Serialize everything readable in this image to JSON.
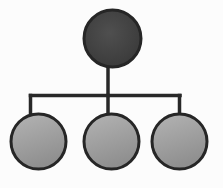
{
  "diagram": {
    "type": "tree",
    "canvas": {
      "width": 223,
      "height": 188,
      "background": "#fcfcfc"
    },
    "connector": {
      "color": "#282828",
      "width": 3.5
    },
    "node_style": {
      "stroke": "#262626",
      "stroke_width": 3,
      "parent_fill_center": "#4f4f4f",
      "parent_fill_edge": "#383838",
      "child_fill_light": "#b4b4b4",
      "child_fill_dark": "#8f8f8f"
    },
    "nodes": [
      {
        "id": "parent",
        "role": "parent",
        "cx": 112.5,
        "cy": 38.5,
        "r": 28.5,
        "shade": "dark"
      },
      {
        "id": "child-1",
        "role": "child",
        "cx": 38.5,
        "cy": 141.5,
        "r": 27.5,
        "shade": "light"
      },
      {
        "id": "child-2",
        "role": "child",
        "cx": 111.5,
        "cy": 141.5,
        "r": 27.5,
        "shade": "light"
      },
      {
        "id": "child-3",
        "role": "child",
        "cx": 179.5,
        "cy": 141.5,
        "r": 27.5,
        "shade": "light"
      }
    ],
    "edges": [
      {
        "id": "edge-parent-stem",
        "x1": 108,
        "y1": 64,
        "x2": 108,
        "y2": 95.5
      },
      {
        "id": "edge-bus",
        "x1": 30.5,
        "y1": 95.5,
        "x2": 180,
        "y2": 95.5
      },
      {
        "id": "edge-drop-child-1",
        "x1": 30.5,
        "y1": 95.5,
        "x2": 30.5,
        "y2": 116
      },
      {
        "id": "edge-drop-child-2",
        "x1": 108,
        "y1": 95.5,
        "x2": 108,
        "y2": 116
      },
      {
        "id": "edge-drop-child-3",
        "x1": 179.5,
        "y1": 95.5,
        "x2": 179.5,
        "y2": 116
      }
    ]
  }
}
